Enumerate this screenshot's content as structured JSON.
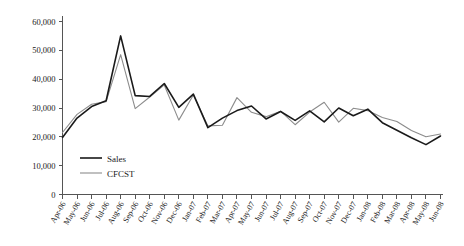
{
  "chart_data": {
    "type": "line",
    "title": "",
    "xlabel": "",
    "ylabel": "",
    "ylim": [
      0,
      60000
    ],
    "ytick_values": [
      0,
      10000,
      20000,
      30000,
      40000,
      50000,
      60000
    ],
    "ytick_labels": [
      "0",
      "10,000",
      "20,000",
      "30,000",
      "40,000",
      "50,000",
      "60,000"
    ],
    "grid": false,
    "legend_position": "inside-bottom-left",
    "categories": [
      "Apr-06",
      "May-06",
      "Jun-06",
      "Jul-06",
      "Aug-06",
      "Sep-06",
      "Oct-06",
      "Nov-06",
      "Dec-06",
      "Jan-07",
      "Feb-07",
      "Mar-07",
      "Apr-07",
      "May-07",
      "Jun-07",
      "Jul-07",
      "Aug-07",
      "Sep-07",
      "Oct-07",
      "Nov-07",
      "Dec-07",
      "Jan-08",
      "Feb-08",
      "Mar-08",
      "Apr-08",
      "May-08",
      "Jun-08"
    ],
    "series": [
      {
        "name": "Sales",
        "color": "#1a1a1a",
        "values": [
          19800,
          26500,
          30500,
          32500,
          55000,
          34300,
          34000,
          38500,
          30200,
          34800,
          23200,
          26500,
          29100,
          30700,
          26200,
          28800,
          25700,
          29000,
          25200,
          30000,
          27300,
          29600,
          24900,
          22300,
          19700,
          17300,
          20300
        ]
      },
      {
        "name": "CFCST",
        "color": "#8c8c8c",
        "values": [
          21500,
          27800,
          31300,
          32200,
          48500,
          29800,
          33800,
          38000,
          25800,
          34500,
          23800,
          24000,
          33600,
          28500,
          27000,
          28900,
          24200,
          28600,
          32000,
          25100,
          29900,
          29100,
          26700,
          25300,
          22200,
          20000,
          21000
        ]
      }
    ]
  },
  "legend": {
    "items": [
      {
        "label": "Sales"
      },
      {
        "label": "CFCST"
      }
    ]
  }
}
